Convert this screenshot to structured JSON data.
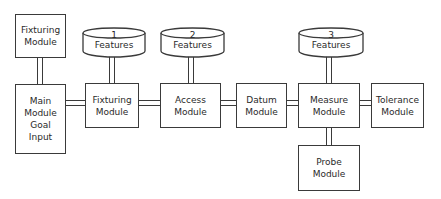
{
  "diagram": {
    "nodes": {
      "fixturing_top": {
        "label": "Fixturing\nModule"
      },
      "main": {
        "label": "Main\nModule\nGoal\nInput"
      },
      "fixturing": {
        "label": "Fixturing\nModule"
      },
      "access": {
        "label": "Access\nModule"
      },
      "datum": {
        "label": "Datum\nModule"
      },
      "measure": {
        "label": "Measure\nModule"
      },
      "tolerance": {
        "label": "Tolerance\nModule"
      },
      "probe": {
        "label": "Probe\nModule"
      }
    },
    "databases": [
      {
        "number": "1",
        "label": "Features"
      },
      {
        "number": "2",
        "label": "Features"
      },
      {
        "number": "3",
        "label": "Features"
      }
    ],
    "colors": {
      "stroke": "#3a3a3a",
      "background": "#ffffff",
      "text": "#2a2a2a"
    }
  }
}
